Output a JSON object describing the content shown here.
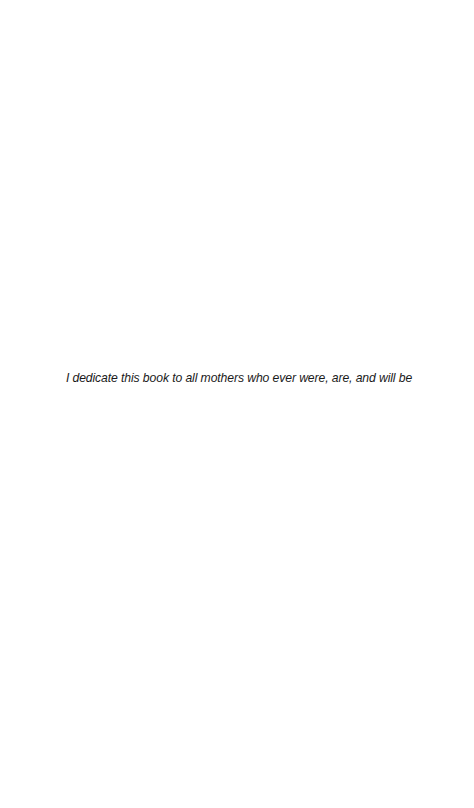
{
  "page": {
    "dedication": "I dedicate this book to all mothers who ever were, are, and will be"
  }
}
